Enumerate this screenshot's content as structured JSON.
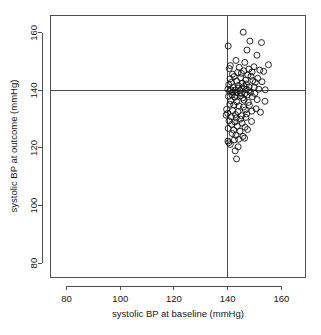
{
  "chart_data": {
    "type": "scatter",
    "title": "",
    "xlabel": "systolic BP at baseline (mmHg)",
    "ylabel": "systolic BP at outcome (mmHg)",
    "xlim": [
      74,
      169
    ],
    "ylim": [
      75,
      166
    ],
    "xticks": [
      80,
      100,
      120,
      140,
      160
    ],
    "yticks": [
      80,
      100,
      120,
      140,
      160
    ],
    "xtick_labels": [
      "80",
      "100",
      "120",
      "140",
      "160"
    ],
    "ytick_labels": [
      "80",
      "100",
      "120",
      "140",
      "160"
    ],
    "grid": false,
    "legend": null,
    "marker": "open-circle",
    "marker_size": 3.0,
    "reference_lines": [
      {
        "name": "baseline-threshold",
        "orientation": "vertical",
        "value": 140
      },
      {
        "name": "outcome-threshold",
        "orientation": "horizontal",
        "value": 140
      }
    ],
    "series": [
      {
        "name": "patients",
        "points": [
          [
            140.2,
            155.4
          ],
          [
            145.8,
            160.2
          ],
          [
            148.3,
            157.1
          ],
          [
            152.6,
            156.6
          ],
          [
            147.2,
            154.0
          ],
          [
            150.9,
            152.2
          ],
          [
            143.1,
            150.4
          ],
          [
            146.4,
            149.7
          ],
          [
            141.0,
            148.6
          ],
          [
            149.8,
            148.2
          ],
          [
            155.2,
            148.9
          ],
          [
            144.3,
            148.0
          ],
          [
            147.9,
            147.4
          ],
          [
            152.0,
            147.0
          ],
          [
            140.6,
            147.6
          ],
          [
            146.0,
            146.8
          ],
          [
            143.7,
            146.2
          ],
          [
            149.1,
            146.4
          ],
          [
            141.8,
            145.6
          ],
          [
            145.1,
            145.9
          ],
          [
            147.5,
            145.3
          ],
          [
            153.4,
            146.6
          ],
          [
            142.4,
            144.8
          ],
          [
            144.9,
            144.4
          ],
          [
            148.7,
            144.9
          ],
          [
            151.2,
            144.2
          ],
          [
            140.9,
            144.0
          ],
          [
            146.7,
            143.6
          ],
          [
            143.3,
            143.2
          ],
          [
            149.4,
            143.4
          ],
          [
            141.4,
            142.8
          ],
          [
            145.5,
            142.5
          ],
          [
            147.0,
            142.2
          ],
          [
            150.3,
            142.8
          ],
          [
            152.8,
            143.0
          ],
          [
            140.4,
            142.0
          ],
          [
            144.0,
            141.7
          ],
          [
            146.2,
            141.4
          ],
          [
            148.0,
            141.2
          ],
          [
            142.1,
            141.0
          ],
          [
            143.9,
            140.8
          ],
          [
            145.3,
            140.6
          ],
          [
            149.9,
            141.1
          ],
          [
            140.1,
            140.4
          ],
          [
            141.2,
            140.2
          ],
          [
            142.8,
            140.1
          ],
          [
            144.5,
            140.0
          ],
          [
            146.9,
            140.3
          ],
          [
            147.8,
            139.9
          ],
          [
            151.6,
            140.4
          ],
          [
            154.0,
            140.2
          ],
          [
            140.7,
            139.6
          ],
          [
            142.0,
            139.4
          ],
          [
            143.5,
            139.2
          ],
          [
            145.0,
            139.0
          ],
          [
            146.4,
            138.8
          ],
          [
            148.5,
            139.3
          ],
          [
            150.1,
            138.9
          ],
          [
            141.6,
            138.5
          ],
          [
            143.0,
            138.3
          ],
          [
            144.7,
            138.1
          ],
          [
            147.3,
            138.4
          ],
          [
            140.3,
            137.9
          ],
          [
            142.6,
            137.6
          ],
          [
            145.6,
            137.4
          ],
          [
            149.2,
            137.8
          ],
          [
            153.9,
            136.2
          ],
          [
            151.0,
            136.8
          ],
          [
            141.1,
            136.4
          ],
          [
            143.4,
            136.0
          ],
          [
            146.1,
            136.6
          ],
          [
            147.7,
            135.8
          ],
          [
            140.8,
            135.2
          ],
          [
            142.3,
            134.9
          ],
          [
            144.2,
            134.6
          ],
          [
            145.9,
            134.2
          ],
          [
            148.1,
            134.8
          ],
          [
            150.6,
            133.6
          ],
          [
            139.6,
            133.4
          ],
          [
            141.9,
            133.0
          ],
          [
            143.8,
            132.6
          ],
          [
            146.6,
            133.2
          ],
          [
            149.0,
            132.8
          ],
          [
            152.2,
            132.4
          ],
          [
            140.0,
            132.0
          ],
          [
            142.9,
            131.6
          ],
          [
            145.2,
            131.2
          ],
          [
            147.1,
            131.8
          ],
          [
            139.4,
            131.4
          ],
          [
            141.3,
            130.8
          ],
          [
            143.2,
            130.4
          ],
          [
            144.8,
            130.0
          ],
          [
            146.8,
            130.6
          ],
          [
            140.5,
            129.4
          ],
          [
            142.7,
            129.0
          ],
          [
            145.4,
            128.6
          ],
          [
            148.9,
            129.2
          ],
          [
            141.5,
            128.2
          ],
          [
            143.6,
            127.6
          ],
          [
            146.5,
            127.2
          ],
          [
            140.2,
            126.8
          ],
          [
            142.2,
            126.2
          ],
          [
            144.6,
            125.8
          ],
          [
            147.4,
            126.4
          ],
          [
            141.7,
            125.0
          ],
          [
            143.1,
            124.4
          ],
          [
            145.7,
            124.0
          ],
          [
            146.3,
            123.4
          ],
          [
            140.1,
            122.4
          ],
          [
            140.4,
            121.8
          ],
          [
            142.5,
            122.8
          ],
          [
            144.1,
            123.0
          ],
          [
            141.0,
            121.2
          ],
          [
            143.9,
            120.4
          ],
          [
            142.8,
            119.0
          ],
          [
            143.3,
            116.2
          ]
        ]
      }
    ]
  }
}
